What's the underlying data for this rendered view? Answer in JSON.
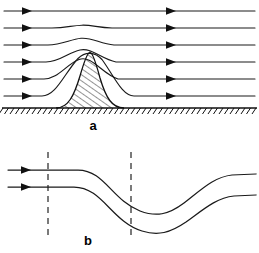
{
  "figure": {
    "background_color": "#ffffff",
    "line_color": "#111111",
    "dash_color": "#2b2b2b",
    "width": 259,
    "height": 253
  },
  "panels": [
    {
      "id": "a",
      "label": "a",
      "label_x": 93,
      "label_y": 130,
      "description": "Flow over a hatched hill with horizontal streamlines deflected upward",
      "ground": {
        "baseline_y": 108,
        "x_start": 2,
        "x_end": 257,
        "hatch_tick_count": 46,
        "hatch_tick_length": 6
      },
      "hill": {
        "peak_x": 90,
        "peak_y": 52,
        "base_left_x": 56,
        "base_right_x": 124,
        "fill": "diagonal-hatch",
        "hatch_spacing": 4,
        "hatch_angle_deg": 60
      },
      "streamlines": [
        {
          "index": 1,
          "inlet_y": 11,
          "outlet_y": 11,
          "deflection": 0.0,
          "arrow_left_x": 26,
          "arrow_right_x": 170
        },
        {
          "index": 2,
          "inlet_y": 28,
          "outlet_y": 28,
          "deflection": 3.0,
          "arrow_left_x": 26,
          "arrow_right_x": 170
        },
        {
          "index": 3,
          "inlet_y": 45,
          "outlet_y": 45,
          "deflection": 7.0,
          "arrow_left_x": 26,
          "arrow_right_x": 170
        },
        {
          "index": 4,
          "inlet_y": 62,
          "outlet_y": 62,
          "deflection": 13.0,
          "arrow_left_x": 26,
          "arrow_right_x": 170
        },
        {
          "index": 5,
          "inlet_y": 79,
          "outlet_y": 79,
          "deflection": 22.0,
          "arrow_left_x": 26,
          "arrow_right_x": 170
        },
        {
          "index": 6,
          "inlet_y": 96,
          "outlet_y": 96,
          "deflection": 40.0,
          "arrow_left_x": 26,
          "arrow_right_x": 170
        }
      ]
    },
    {
      "id": "b",
      "label": "b",
      "label_x": 88,
      "label_y": 245,
      "description": "Two wavy streamlines descending into a trough then rising, crossed by two vertical dashed reference lines",
      "dashed_lines": [
        {
          "name": "dashed-line-left",
          "x": 48,
          "y_top": 152,
          "y_bottom": 238
        },
        {
          "name": "dashed-line-right",
          "x": 131,
          "y_top": 152,
          "y_bottom": 238
        }
      ],
      "streamlines": [
        {
          "index": 1,
          "inlet_y": 170,
          "trough_y": 215,
          "trough_x": 172,
          "outlet_y": 174,
          "arrow_x": 26
        },
        {
          "index": 2,
          "inlet_y": 187,
          "trough_y": 234,
          "trough_x": 176,
          "outlet_y": 196,
          "arrow_x": 26
        }
      ]
    }
  ]
}
